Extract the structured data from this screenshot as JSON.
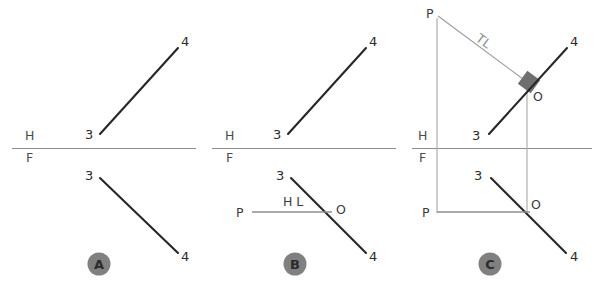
{
  "figure": {
    "background_color": "#ffffff",
    "line_color_heavy": "#272727",
    "line_color_light": "#9a9a9a",
    "badge_color": "#808080",
    "tl_label_color": "#8c8c8c",
    "square_marker_color": "#6f6f6f"
  },
  "panels": [
    {
      "id": "A",
      "badge_label": "A",
      "fold_labels": {
        "top": "H",
        "bottom": "F"
      },
      "top_view": {
        "endpoint_start_label": "3",
        "endpoint_end_label": "4"
      },
      "front_view": {
        "endpoint_start_label": "3",
        "endpoint_end_label": "4"
      },
      "aux_labels": []
    },
    {
      "id": "B",
      "badge_label": "B",
      "fold_labels": {
        "top": "H",
        "bottom": "F"
      },
      "top_view": {
        "endpoint_start_label": "3",
        "endpoint_end_label": "4"
      },
      "front_view": {
        "endpoint_start_label": "3",
        "endpoint_end_label": "4"
      },
      "aux_labels": [
        {
          "name": "pivot-point-label",
          "text": "P"
        },
        {
          "name": "horizontal-line-label",
          "text": "H L"
        },
        {
          "name": "origin-point-label",
          "text": "O"
        }
      ]
    },
    {
      "id": "C",
      "badge_label": "C",
      "fold_labels": {
        "top": "H",
        "bottom": "F"
      },
      "top_view": {
        "endpoint_start_label": "3",
        "endpoint_end_label": "4"
      },
      "front_view": {
        "endpoint_start_label": "3",
        "endpoint_end_label": "4"
      },
      "aux_labels": [
        {
          "name": "pivot-point-label-top",
          "text": "P"
        },
        {
          "name": "true-length-label",
          "text": "TL"
        },
        {
          "name": "origin-point-label-top",
          "text": "O"
        },
        {
          "name": "pivot-point-label-bottom",
          "text": "P"
        },
        {
          "name": "origin-point-label-bottom",
          "text": "O"
        }
      ]
    }
  ],
  "labels": {
    "h": "H",
    "f": "F",
    "p": "P",
    "o": "O",
    "hl": "H L",
    "tl": "TL",
    "three": "3",
    "four": "4",
    "badge_a": "A",
    "badge_b": "B",
    "badge_c": "C"
  }
}
